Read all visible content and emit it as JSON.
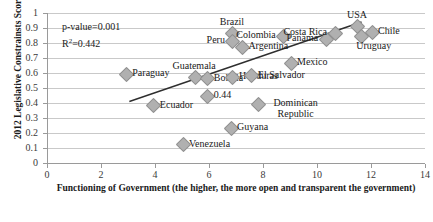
{
  "chart_data": {
    "type": "scatter",
    "title": "",
    "xlabel": "Functioning of Government (the higher, the more open and transparent the government)",
    "ylabel": "2012 Legislative Constrainsts Score",
    "xlim": [
      0,
      14
    ],
    "ylim": [
      0,
      1
    ],
    "xticks": [
      0,
      2,
      4,
      6,
      8,
      10,
      12,
      14
    ],
    "yticks": [
      "0",
      "0.1",
      "0.2",
      "0.3",
      "0.4",
      "0.5",
      "0.6",
      "0.7",
      "0.8",
      "0.9",
      "1"
    ],
    "grid": true,
    "legend": "none",
    "annotations": {
      "p_value": "p-value=0.001",
      "r_squared_prefix": "R",
      "r_squared_sup": "2",
      "r_squared_value": "=0.442",
      "data_label": "0.44"
    },
    "trendline": {
      "type": "linear",
      "x_start": 3.05,
      "y_start": 0.41,
      "x_end": 11.65,
      "y_end": 0.94
    },
    "points": [
      {
        "label": "Paraguay",
        "x": 2.9,
        "y": 0.6,
        "label_pos": "right"
      },
      {
        "label": "Ecuador",
        "x": 3.92,
        "y": 0.387,
        "label_pos": "right"
      },
      {
        "label": "Venezuela",
        "x": 5.0,
        "y": 0.127,
        "label_pos": "right"
      },
      {
        "label": "Guatemala",
        "x": 5.45,
        "y": 0.58,
        "label_pos": "above"
      },
      {
        "label": "Bolivia",
        "x": 5.92,
        "y": 0.567,
        "label_pos": "right"
      },
      {
        "label": "0.44",
        "x": 5.92,
        "y": 0.453,
        "label_pos": "right",
        "is_value_label": true
      },
      {
        "label": "Honduras",
        "x": 6.85,
        "y": 0.58,
        "label_pos": "right"
      },
      {
        "label": "El Salvador",
        "x": 7.55,
        "y": 0.587,
        "label_pos": "right"
      },
      {
        "label": "Brazil",
        "x": 6.85,
        "y": 0.873,
        "label_pos": "above"
      },
      {
        "label": "Peru",
        "x": 6.85,
        "y": 0.82,
        "label_pos": "left"
      },
      {
        "label": "Argentina",
        "x": 7.2,
        "y": 0.78,
        "label_pos": "right"
      },
      {
        "label": "Colombia",
        "x": 8.73,
        "y": 0.853,
        "label_pos": "left"
      },
      {
        "label": "Mexico",
        "x": 9.0,
        "y": 0.673,
        "label_pos": "right"
      },
      {
        "label": "Dominican Republic",
        "x": 7.8,
        "y": 0.4,
        "label_pos": "right"
      },
      {
        "label": "Guyana",
        "x": 6.78,
        "y": 0.24,
        "label_pos": "right"
      },
      {
        "label": "Panama",
        "x": 10.3,
        "y": 0.833,
        "label_pos": "left"
      },
      {
        "label": "Costa Rica",
        "x": 10.63,
        "y": 0.873,
        "label_pos": "left"
      },
      {
        "label": "USA",
        "x": 11.48,
        "y": 0.92,
        "label_pos": "above"
      },
      {
        "label": "Chile",
        "x": 12.0,
        "y": 0.88,
        "label_pos": "right"
      },
      {
        "label": "Uruguay",
        "x": 11.6,
        "y": 0.853,
        "label_pos": "below-right"
      }
    ]
  }
}
